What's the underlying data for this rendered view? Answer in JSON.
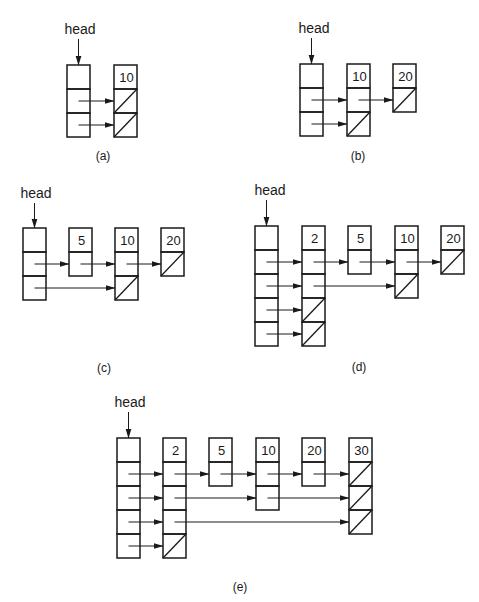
{
  "diagram": {
    "head_label": "head",
    "colors": {
      "stroke": "#1a1a1a",
      "background": "#ffffff"
    },
    "cell_size": {
      "w": 23,
      "h": 24
    },
    "panels": [
      {
        "id": "a",
        "caption": "(a)",
        "caption_pos": [
          103,
          160
        ],
        "head": {
          "x": 67,
          "y": 65,
          "levels": 3,
          "label_pos": [
            80,
            34
          ]
        },
        "nodes": [
          {
            "value": "10",
            "x": 114,
            "y": 65,
            "levels": 2,
            "null_levels": [
              0,
              1
            ]
          }
        ],
        "links": [
          {
            "from": "head",
            "level": 0,
            "to": 0
          },
          {
            "from": "head",
            "level": 1,
            "to": 0
          }
        ]
      },
      {
        "id": "b",
        "caption": "(b)",
        "caption_pos": [
          358,
          160
        ],
        "head": {
          "x": 300,
          "y": 64,
          "levels": 3,
          "label_pos": [
            314,
            33
          ]
        },
        "nodes": [
          {
            "value": "10",
            "x": 347,
            "y": 64,
            "levels": 2,
            "null_levels": [
              1
            ]
          },
          {
            "value": "20",
            "x": 393,
            "y": 64,
            "levels": 1,
            "null_levels": [
              0
            ]
          }
        ],
        "links": [
          {
            "from": "head",
            "level": 0,
            "to": 0
          },
          {
            "from": "head",
            "level": 1,
            "to": 0
          },
          {
            "from": 0,
            "level": 0,
            "to": 1
          }
        ]
      },
      {
        "id": "c",
        "caption": "(c)",
        "caption_pos": [
          104,
          372
        ],
        "head": {
          "x": 23,
          "y": 228,
          "levels": 3,
          "label_pos": [
            36,
            198
          ]
        },
        "nodes": [
          {
            "value": "5",
            "x": 69,
            "y": 228,
            "levels": 1,
            "null_levels": []
          },
          {
            "value": "10",
            "x": 115,
            "y": 228,
            "levels": 2,
            "null_levels": [
              1
            ]
          },
          {
            "value": "20",
            "x": 161,
            "y": 228,
            "levels": 1,
            "null_levels": [
              0
            ]
          }
        ],
        "links": [
          {
            "from": "head",
            "level": 0,
            "to": 0
          },
          {
            "from": 0,
            "level": 0,
            "to": 1
          },
          {
            "from": 1,
            "level": 0,
            "to": 2
          },
          {
            "from": "head",
            "level": 1,
            "to": 1
          }
        ]
      },
      {
        "id": "d",
        "caption": "(d)",
        "caption_pos": [
          359,
          371
        ],
        "head": {
          "x": 255,
          "y": 226,
          "levels": 5,
          "label_pos": [
            270,
            195
          ]
        },
        "nodes": [
          {
            "value": "2",
            "x": 302,
            "y": 226,
            "levels": 4,
            "null_levels": [
              2,
              3
            ]
          },
          {
            "value": "5",
            "x": 348,
            "y": 226,
            "levels": 1,
            "null_levels": []
          },
          {
            "value": "10",
            "x": 395,
            "y": 226,
            "levels": 2,
            "null_levels": [
              1
            ]
          },
          {
            "value": "20",
            "x": 441,
            "y": 226,
            "levels": 1,
            "null_levels": [
              0
            ]
          }
        ],
        "links": [
          {
            "from": "head",
            "level": 0,
            "to": 0
          },
          {
            "from": "head",
            "level": 1,
            "to": 0
          },
          {
            "from": "head",
            "level": 2,
            "to": 0
          },
          {
            "from": "head",
            "level": 3,
            "to": 0
          },
          {
            "from": 0,
            "level": 0,
            "to": 1
          },
          {
            "from": 1,
            "level": 0,
            "to": 2
          },
          {
            "from": 2,
            "level": 0,
            "to": 3
          },
          {
            "from": 0,
            "level": 1,
            "to": 2
          }
        ]
      },
      {
        "id": "e",
        "caption": "(e)",
        "caption_pos": [
          240,
          591
        ],
        "head": {
          "x": 117,
          "y": 438,
          "levels": 5,
          "label_pos": [
            130,
            407
          ]
        },
        "nodes": [
          {
            "value": "2",
            "x": 163,
            "y": 438,
            "levels": 4,
            "null_levels": [
              3
            ]
          },
          {
            "value": "5",
            "x": 209,
            "y": 438,
            "levels": 1,
            "null_levels": []
          },
          {
            "value": "10",
            "x": 256,
            "y": 438,
            "levels": 2,
            "null_levels": []
          },
          {
            "value": "20",
            "x": 302,
            "y": 438,
            "levels": 1,
            "null_levels": []
          },
          {
            "value": "30",
            "x": 349,
            "y": 438,
            "levels": 3,
            "null_levels": [
              0,
              1,
              2
            ]
          }
        ],
        "links": [
          {
            "from": "head",
            "level": 0,
            "to": 0
          },
          {
            "from": "head",
            "level": 1,
            "to": 0
          },
          {
            "from": "head",
            "level": 2,
            "to": 0
          },
          {
            "from": "head",
            "level": 3,
            "to": 0
          },
          {
            "from": 0,
            "level": 0,
            "to": 1
          },
          {
            "from": 1,
            "level": 0,
            "to": 2
          },
          {
            "from": 2,
            "level": 0,
            "to": 3
          },
          {
            "from": 3,
            "level": 0,
            "to": 4
          },
          {
            "from": 0,
            "level": 1,
            "to": 2
          },
          {
            "from": 2,
            "level": 1,
            "to": 4
          },
          {
            "from": 0,
            "level": 2,
            "to": 4
          }
        ]
      }
    ]
  }
}
